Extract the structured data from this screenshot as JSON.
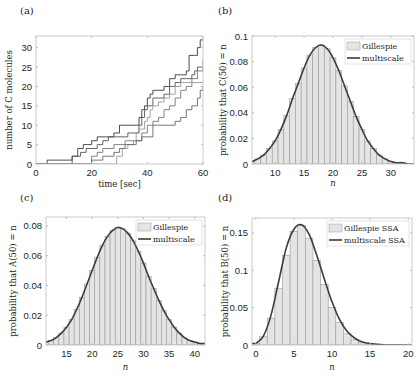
{
  "chart_data": [
    {
      "panel": "(a)",
      "type": "line",
      "title": "",
      "xlabel": "time [sec]",
      "ylabel": "number of C molecules",
      "xlim": [
        0,
        60
      ],
      "ylim": [
        0,
        33
      ],
      "xticks": [
        0,
        20,
        40,
        60
      ],
      "yticks": [
        0,
        5,
        10,
        15,
        20,
        25,
        30
      ],
      "grid": false,
      "step": true,
      "series": [
        {
          "name": "trajectory 1",
          "color": "#3a3a3a",
          "x": [
            0,
            4,
            12,
            13,
            15,
            17,
            20,
            22,
            25,
            28,
            30,
            34,
            36,
            37,
            38,
            39,
            40,
            41,
            42,
            44,
            46,
            48,
            50,
            52,
            54,
            55,
            57,
            58,
            59,
            60
          ],
          "y": [
            0,
            1,
            1,
            2,
            4,
            5,
            6,
            7,
            7,
            8,
            10,
            10,
            10,
            12,
            14,
            15,
            17,
            18,
            19,
            19,
            20,
            22,
            23,
            23,
            24,
            28,
            28,
            30,
            32,
            32
          ]
        },
        {
          "name": "trajectory 2",
          "color": "#555555",
          "x": [
            0,
            12,
            13,
            16,
            18,
            22,
            24,
            26,
            29,
            33,
            36,
            37,
            38,
            39,
            40,
            42,
            44,
            46,
            48,
            50,
            52,
            54,
            56,
            57,
            58,
            60
          ],
          "y": [
            0,
            0,
            2,
            3,
            4,
            5,
            6,
            7,
            7,
            8,
            8,
            10,
            12,
            14,
            15,
            17,
            17,
            18,
            20,
            21,
            22,
            22,
            23,
            24,
            25,
            25
          ]
        },
        {
          "name": "trajectory 3",
          "color": "#777777",
          "x": [
            0,
            15,
            20,
            22,
            24,
            28,
            32,
            35,
            38,
            40,
            42,
            44,
            46,
            48,
            50,
            52,
            54,
            56,
            58,
            60
          ],
          "y": [
            0,
            0,
            2,
            3,
            4,
            5,
            6,
            6,
            8,
            10,
            11,
            12,
            14,
            15,
            17,
            19,
            20,
            22,
            24,
            27
          ]
        },
        {
          "name": "trajectory 4",
          "color": "#999999",
          "x": [
            0,
            18,
            28,
            29,
            31,
            33,
            35,
            36,
            37,
            39,
            40,
            41,
            42,
            44,
            46,
            48,
            50,
            52,
            54,
            60
          ],
          "y": [
            0,
            0,
            0,
            2,
            4,
            5,
            6,
            8,
            9,
            11,
            12,
            14,
            15,
            16,
            17,
            18,
            20,
            21,
            21,
            21
          ]
        },
        {
          "name": "trajectory 5",
          "color": "#666666",
          "x": [
            0,
            15,
            20,
            24,
            28,
            30,
            32,
            34,
            36,
            38,
            42,
            46,
            48,
            50,
            52,
            54,
            56,
            58,
            59,
            60
          ],
          "y": [
            0,
            0,
            1,
            2,
            3,
            4,
            5,
            5,
            6,
            7,
            10,
            10,
            10,
            11,
            12,
            14,
            15,
            17,
            19,
            20
          ]
        }
      ]
    },
    {
      "panel": "(b)",
      "type": "bar",
      "title": "",
      "xlabel": "n",
      "ylabel": "probability that C(50) = n",
      "xlim": [
        6,
        34
      ],
      "ylim": [
        0,
        0.1
      ],
      "xticks": [
        10,
        15,
        20,
        25,
        30
      ],
      "yticks": [
        0,
        0.02,
        0.04,
        0.06,
        0.08,
        0.1
      ],
      "legend": {
        "position": "upper right",
        "entries": [
          "Gillespie",
          "multiscale"
        ]
      },
      "distribution": {
        "mean": 18.2,
        "sd": 4.3,
        "peak": 0.093
      },
      "categories": [
        6,
        7,
        8,
        9,
        10,
        11,
        12,
        13,
        14,
        15,
        16,
        17,
        18,
        19,
        20,
        21,
        22,
        23,
        24,
        25,
        26,
        27,
        28,
        29,
        30,
        31,
        32,
        33,
        34
      ],
      "series": [
        {
          "name": "Gillespie",
          "style": "bar",
          "values": [
            0.002,
            0.004,
            0.007,
            0.012,
            0.018,
            0.027,
            0.038,
            0.051,
            0.063,
            0.075,
            0.085,
            0.091,
            0.093,
            0.09,
            0.083,
            0.073,
            0.061,
            0.049,
            0.037,
            0.027,
            0.018,
            0.012,
            0.007,
            0.004,
            0.002,
            0.001,
            0.001,
            0.0,
            0.0
          ]
        },
        {
          "name": "multiscale",
          "style": "line",
          "values": [
            0.002,
            0.004,
            0.007,
            0.012,
            0.018,
            0.027,
            0.038,
            0.051,
            0.063,
            0.075,
            0.085,
            0.091,
            0.093,
            0.09,
            0.083,
            0.073,
            0.061,
            0.049,
            0.037,
            0.027,
            0.018,
            0.012,
            0.007,
            0.004,
            0.002,
            0.001,
            0.001,
            0.0,
            0.0
          ]
        }
      ]
    },
    {
      "panel": "(c)",
      "type": "bar",
      "title": "",
      "xlabel": "n",
      "ylabel": "probability that A(50) = n",
      "xlim": [
        11,
        42
      ],
      "ylim": [
        0,
        0.086
      ],
      "xticks": [
        15,
        20,
        25,
        30,
        35,
        40
      ],
      "yticks": [
        0,
        0.02,
        0.04,
        0.06,
        0.08
      ],
      "legend": {
        "position": "upper right",
        "entries": [
          "Gillespie",
          "multiscale"
        ]
      },
      "distribution": {
        "mean": 25.2,
        "sd": 5.0,
        "peak": 0.079
      },
      "categories": [
        11,
        12,
        13,
        14,
        15,
        16,
        17,
        18,
        19,
        20,
        21,
        22,
        23,
        24,
        25,
        26,
        27,
        28,
        29,
        30,
        31,
        32,
        33,
        34,
        35,
        36,
        37,
        38,
        39,
        40,
        41,
        42
      ],
      "series": [
        {
          "name": "Gillespie",
          "style": "bar",
          "values": [
            0.002,
            0.003,
            0.005,
            0.008,
            0.012,
            0.017,
            0.024,
            0.032,
            0.041,
            0.05,
            0.059,
            0.067,
            0.073,
            0.077,
            0.079,
            0.078,
            0.075,
            0.07,
            0.063,
            0.055,
            0.046,
            0.038,
            0.03,
            0.023,
            0.017,
            0.012,
            0.008,
            0.005,
            0.003,
            0.002,
            0.001,
            0.001
          ]
        },
        {
          "name": "multiscale",
          "style": "line",
          "values": [
            0.002,
            0.003,
            0.005,
            0.008,
            0.012,
            0.017,
            0.024,
            0.032,
            0.041,
            0.05,
            0.059,
            0.067,
            0.073,
            0.077,
            0.079,
            0.078,
            0.075,
            0.07,
            0.063,
            0.055,
            0.046,
            0.038,
            0.03,
            0.023,
            0.017,
            0.012,
            0.008,
            0.005,
            0.003,
            0.002,
            0.001,
            0.001
          ]
        }
      ]
    },
    {
      "panel": "(d)",
      "type": "bar",
      "title": "",
      "xlabel": "n",
      "ylabel": "probability that B(50) = n",
      "xlim": [
        -0.5,
        20.5
      ],
      "ylim": [
        0,
        0.17
      ],
      "xticks": [
        0,
        5,
        10,
        15,
        20
      ],
      "yticks": [
        0,
        0.05,
        0.1,
        0.15
      ],
      "legend": {
        "position": "upper right",
        "entries": [
          "Gillespie SSA",
          "multiscale SSA"
        ]
      },
      "categories": [
        0,
        1,
        2,
        3,
        4,
        5,
        6,
        7,
        8,
        9,
        10,
        11,
        12,
        13,
        14,
        15,
        16,
        17,
        18,
        19,
        20
      ],
      "series": [
        {
          "name": "Gillespie SSA",
          "style": "bar",
          "values": [
            0.002,
            0.011,
            0.036,
            0.076,
            0.12,
            0.152,
            0.16,
            0.143,
            0.113,
            0.081,
            0.05,
            0.03,
            0.015,
            0.007,
            0.003,
            0.001,
            0.0,
            0.0,
            0.0,
            0.0,
            0.0
          ]
        },
        {
          "name": "multiscale SSA",
          "style": "line",
          "values": [
            0.002,
            0.012,
            0.04,
            0.085,
            0.13,
            0.155,
            0.161,
            0.148,
            0.12,
            0.088,
            0.058,
            0.034,
            0.018,
            0.009,
            0.004,
            0.002,
            0.001,
            0.0,
            0.0,
            0.0,
            0.0
          ]
        }
      ]
    }
  ],
  "colors": {
    "bar_fill": "#e4e4e4",
    "bar_edge": "#9a9a9a",
    "line": "#3c3c3c",
    "axis": "#bdbdbd",
    "text": "#262626"
  }
}
